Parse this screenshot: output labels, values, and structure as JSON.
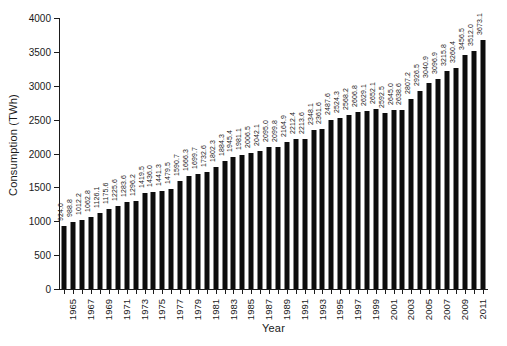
{
  "chart_data": {
    "type": "bar",
    "title": "",
    "subtitle": "",
    "xlabel": "Year",
    "ylabel": "Consumption (TWh)",
    "ylim": [
      0,
      4000
    ],
    "ytick_step": 500,
    "ytick_labels": [
      "0",
      "500",
      "1000",
      "1500",
      "2000",
      "2500",
      "3000",
      "3500",
      "4000"
    ],
    "xtick_labels": [
      "1965",
      "1967",
      "1969",
      "1971",
      "1973",
      "1975",
      "1977",
      "1979",
      "1981",
      "1983",
      "1985",
      "1987",
      "1989",
      "1991",
      "1993",
      "1995",
      "1997",
      "1999",
      "2001",
      "2003",
      "2005",
      "2007",
      "2009",
      "2011"
    ],
    "grid": false,
    "legend": "none",
    "bar_color": "#0d0d0d",
    "data_labels_shown": true,
    "data_label_rotation": "vertical",
    "categories": [
      "1965",
      "1966",
      "1967",
      "1968",
      "1969",
      "1970",
      "1971",
      "1972",
      "1973",
      "1974",
      "1975",
      "1976",
      "1977",
      "1978",
      "1979",
      "1980",
      "1981",
      "1982",
      "1983",
      "1984",
      "1985",
      "1986",
      "1987",
      "1988",
      "1989",
      "1990",
      "1991",
      "1992",
      "1993",
      "1994",
      "1995",
      "1996",
      "1997",
      "1998",
      "1999",
      "2000",
      "2001",
      "2002",
      "2003",
      "2004",
      "2005",
      "2006",
      "2007",
      "2008",
      "2009",
      "2010",
      "2011",
      "2012"
    ],
    "values": [
      924.0,
      988.8,
      1012.2,
      1062.8,
      1126.1,
      1175.6,
      1225.6,
      1283.6,
      1296.2,
      1419.5,
      1436.0,
      1441.3,
      1479.5,
      1590.7,
      1666.3,
      1699.7,
      1732.6,
      1802.3,
      1884.3,
      1945.4,
      1981.1,
      2006.5,
      2042.1,
      2095.0,
      2099.8,
      2164.9,
      2212.4,
      2213.6,
      2348.1,
      2361.6,
      2487.6,
      2524.3,
      2568.2,
      2606.8,
      2629.1,
      2652.1,
      2592.5,
      2645.0,
      2638.6,
      2807.2,
      2926.5,
      3040.9,
      3096.9,
      3215.8,
      3260.4,
      3456.5,
      3512.0,
      3673.1
    ],
    "value_labels": [
      "924.0",
      "988.8",
      "1012.2",
      "1062.8",
      "1126.1",
      "1175.6",
      "1225.6",
      "1283.6",
      "1296.2",
      "1419.5",
      "1436.0",
      "1441.3",
      "1479.5",
      "1590.7",
      "1666.3",
      "1699.7",
      "1732.6",
      "1802.3",
      "1884.3",
      "1945.4",
      "1981.1",
      "2006.5",
      "2042.1",
      "2095.0",
      "2099.8",
      "2164.9",
      "2212.4",
      "2213.6",
      "2348.1",
      "2361.6",
      "2487.6",
      "2524.3",
      "2568.2",
      "2606.8",
      "2629.1",
      "2652.1",
      "2592.5",
      "2645.0",
      "2638.6",
      "2807.2",
      "2926.5",
      "3040.9",
      "3096.9",
      "3215.8",
      "3260.4",
      "3456.5",
      "3512.0",
      "3673.1"
    ]
  }
}
